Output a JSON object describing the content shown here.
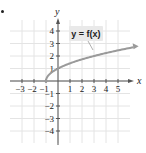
{
  "bullet": "•",
  "chart_data": {
    "type": "line",
    "title": "",
    "function_label": "y = f(x)",
    "function_expression": "f(x) = sqrt(x + 1)",
    "xlabel": "x",
    "ylabel": "y",
    "xlim": [
      -4,
      6.5
    ],
    "ylim": [
      -5,
      5
    ],
    "grid": true,
    "x_ticks": [
      -3,
      -2,
      -1,
      1,
      2,
      3,
      4,
      5
    ],
    "x_tick_labels": [
      "−3",
      "−2",
      "−1",
      "1",
      "2",
      "3",
      "4",
      "5"
    ],
    "y_ticks": [
      4,
      3,
      2,
      1,
      -1,
      -2,
      -3,
      -4
    ],
    "y_tick_labels": [
      "4",
      "3",
      "2",
      "1",
      "−1",
      "−2",
      "−3",
      "−4"
    ],
    "series": [
      {
        "name": "y = f(x)",
        "x": [
          -1,
          -0.75,
          0,
          1,
          2,
          3,
          4,
          5,
          6
        ],
        "y": [
          0,
          0.5,
          1,
          1.41,
          1.73,
          2,
          2.24,
          2.45,
          2.65
        ],
        "start_point": [
          -1,
          0
        ],
        "end_arrow": true,
        "color": "#9a9a9a"
      }
    ],
    "colors": {
      "axis": "#555555",
      "grid": "#e4e4e4",
      "curve": "#9a9a9a",
      "label_box": "#e9e9e9",
      "text": "#222222"
    }
  }
}
